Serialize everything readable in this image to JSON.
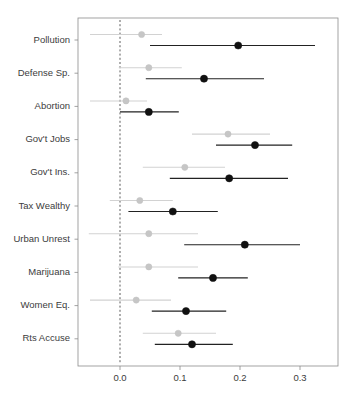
{
  "chart_data": {
    "type": "scatter",
    "title": "",
    "subtitle": "",
    "xlabel": "",
    "ylabel": "",
    "xlim": [
      -0.052,
      0.345
    ],
    "grid": false,
    "legend": null,
    "zero_reference_line": 0.0,
    "xticks": [
      0.0,
      0.1,
      0.2,
      0.3
    ],
    "xtick_labels": [
      "0.0",
      "0.1",
      "0.2",
      "0.3"
    ],
    "categories": [
      "Pollution",
      "Defense Sp.",
      "Abortion",
      "Gov't Jobs",
      "Gov't Ins.",
      "Tax Wealthy",
      "Urban Unrest",
      "Marijuana",
      "Women Eq.",
      "Rts Accuse"
    ],
    "series": [
      {
        "name": "light",
        "color": "#c6c6c6",
        "estimates": [
          0.036,
          0.048,
          0.01,
          0.18,
          0.108,
          0.033,
          0.048,
          0.048,
          0.027,
          0.097
        ],
        "ci_low": [
          -0.05,
          -0.002,
          -0.05,
          0.12,
          0.038,
          -0.017,
          -0.052,
          -0.003,
          -0.05,
          0.038
        ],
        "ci_high": [
          0.07,
          0.103,
          0.045,
          0.25,
          0.175,
          0.088,
          0.13,
          0.13,
          0.085,
          0.16
        ]
      },
      {
        "name": "dark",
        "color": "#111111",
        "estimates": [
          0.197,
          0.14,
          0.048,
          0.225,
          0.182,
          0.088,
          0.208,
          0.155,
          0.11,
          0.12
        ],
        "ci_low": [
          0.05,
          0.043,
          0.0,
          0.16,
          0.083,
          0.014,
          0.107,
          0.097,
          0.053,
          0.058
        ],
        "ci_high": [
          0.325,
          0.24,
          0.098,
          0.287,
          0.28,
          0.163,
          0.3,
          0.213,
          0.177,
          0.188
        ]
      }
    ]
  },
  "axes": {
    "x_axis_name": "coefficient-axis",
    "y_axis_name": "variable-axis"
  }
}
